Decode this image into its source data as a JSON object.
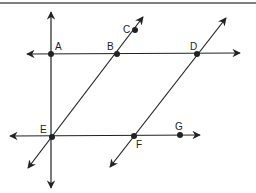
{
  "diagram": {
    "type": "geometry-lines",
    "stroke_color": "#222222",
    "border_color": "#555555",
    "points": {
      "A": {
        "label": "A",
        "x": 51,
        "y": 54
      },
      "B": {
        "label": "B",
        "x": 117,
        "y": 54
      },
      "C": {
        "label": "C",
        "x": 135,
        "y": 30
      },
      "D": {
        "label": "D",
        "x": 197,
        "y": 54
      },
      "E": {
        "label": "E",
        "x": 52,
        "y": 137
      },
      "F": {
        "label": "F",
        "x": 134,
        "y": 136
      },
      "G": {
        "label": "G",
        "x": 180,
        "y": 135
      }
    },
    "lines": [
      {
        "name": "line-AD",
        "desc": "horizontal line through A, B, D"
      },
      {
        "name": "line-EG",
        "desc": "horizontal ray/line through E, F, G"
      },
      {
        "name": "line-AE",
        "desc": "vertical line through A and E"
      },
      {
        "name": "line-EC",
        "desc": "transversal through E, B, C"
      },
      {
        "name": "line-FD",
        "desc": "transversal through F and D"
      }
    ]
  }
}
